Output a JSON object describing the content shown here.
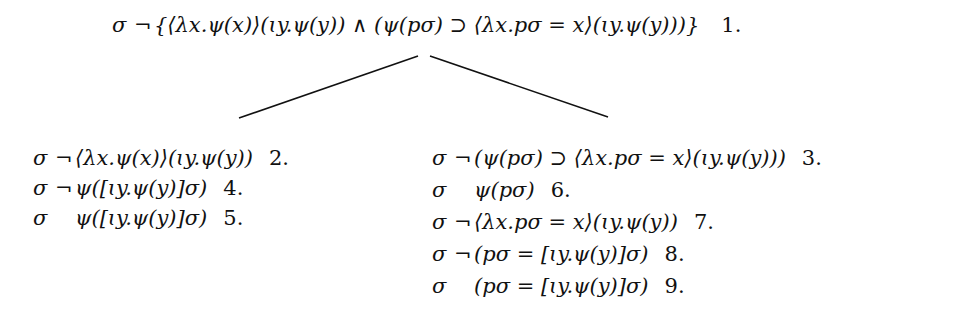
{
  "root": {
    "sign": "σ",
    "neg": "¬",
    "formula": "{⟨λx.ψ(x)⟩(ɩy.ψ(y)) ∧ (ψ(pσ) ⊃ ⟨λx.pσ = x⟩(ɩy.ψ(y)))}",
    "number": "1."
  },
  "left_branch": [
    {
      "sign": "σ",
      "neg": "¬",
      "formula": "⟨λx.ψ(x)⟩(ɩy.ψ(y))",
      "number": "2."
    },
    {
      "sign": "σ",
      "neg": "¬",
      "formula": "ψ([ɩy.ψ(y)]σ)",
      "number": "4."
    },
    {
      "sign": "σ",
      "neg": "",
      "formula": "ψ([ɩy.ψ(y)]σ)",
      "number": "5."
    }
  ],
  "right_branch": [
    {
      "sign": "σ",
      "neg": "¬",
      "formula": "(ψ(pσ) ⊃ ⟨λx.pσ = x⟩(ɩy.ψ(y)))",
      "number": "3."
    },
    {
      "sign": "σ",
      "neg": "",
      "formula": "ψ(pσ)",
      "number": "6."
    },
    {
      "sign": "σ",
      "neg": "¬",
      "formula": "⟨λx.pσ = x⟩(ɩy.ψ(y))",
      "number": "7."
    },
    {
      "sign": "σ",
      "neg": "¬",
      "formula": "(pσ = [ɩy.ψ(y)]σ)",
      "number": "8."
    },
    {
      "sign": "σ",
      "neg": "",
      "formula": "(pσ = [ɩy.ψ(y)]σ)",
      "number": "9."
    }
  ]
}
